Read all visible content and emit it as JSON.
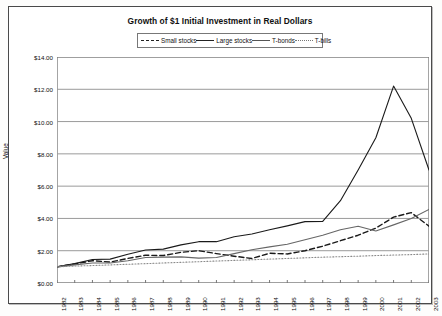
{
  "chart_data": {
    "type": "line",
    "title": "Growth of $1 Initial Investment in Real Dollars",
    "xlabel": "",
    "ylabel": "Value",
    "ylim": [
      0,
      14
    ],
    "ytick_labels": [
      "$0.00",
      "$2.00",
      "$4.00",
      "$6.00",
      "$8.00",
      "$10.00",
      "$12.00",
      "$14.00"
    ],
    "ytick_values": [
      0,
      2,
      4,
      6,
      8,
      10,
      12,
      14
    ],
    "grid": true,
    "legend_position": "top-center",
    "categories": [
      "1982",
      "1983",
      "1984",
      "1985",
      "1986",
      "1987",
      "1988",
      "1989",
      "1990",
      "1991",
      "1992",
      "1993",
      "1994",
      "1995",
      "1996",
      "1997",
      "1998",
      "1999",
      "2000",
      "2001",
      "2002",
      "2003"
    ],
    "x": [
      1982,
      1983,
      1984,
      1985,
      1986,
      1987,
      1988,
      1989,
      1990,
      1991,
      1992,
      1993,
      1994,
      1995,
      1996,
      1997,
      1998,
      1999,
      2000,
      2001,
      2002,
      2003
    ],
    "series": [
      {
        "name": "Small stocks",
        "style": "dashed",
        "color": "#1a1a1a",
        "values": [
          1.0,
          1.18,
          1.38,
          1.3,
          1.52,
          1.72,
          1.7,
          1.9,
          2.0,
          1.82,
          1.66,
          1.52,
          1.84,
          1.8,
          2.0,
          2.28,
          2.62,
          2.96,
          3.4,
          4.08,
          4.36,
          3.52
        ]
      },
      {
        "name": "Large stocks",
        "style": "solid",
        "color": "#1a1a1a",
        "values": [
          1.0,
          1.2,
          1.46,
          1.48,
          1.78,
          2.04,
          2.1,
          2.36,
          2.56,
          2.56,
          2.86,
          3.04,
          3.3,
          3.54,
          3.8,
          3.82,
          5.1,
          7.0,
          9.0,
          12.2,
          10.2,
          7.0
        ]
      },
      {
        "name": "T-bonds",
        "style": "solid",
        "color": "#666666",
        "values": [
          1.0,
          1.12,
          1.24,
          1.24,
          1.38,
          1.58,
          1.6,
          1.62,
          1.54,
          1.58,
          1.82,
          2.06,
          2.24,
          2.4,
          2.68,
          2.96,
          3.3,
          3.52,
          3.22,
          3.6,
          4.0,
          4.56
        ]
      },
      {
        "name": "T-bills",
        "style": "dotted",
        "color": "#8a8a8a",
        "values": [
          1.0,
          1.05,
          1.08,
          1.12,
          1.16,
          1.2,
          1.24,
          1.28,
          1.32,
          1.36,
          1.4,
          1.44,
          1.48,
          1.52,
          1.56,
          1.6,
          1.63,
          1.66,
          1.7,
          1.73,
          1.76,
          1.8
        ]
      }
    ]
  },
  "legend": {
    "items": [
      {
        "label": "Small stocks"
      },
      {
        "label": "Large stocks"
      },
      {
        "label": "T-bonds"
      },
      {
        "label": "T-bills"
      }
    ]
  }
}
